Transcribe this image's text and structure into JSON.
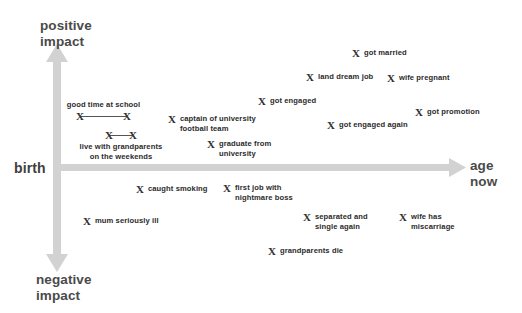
{
  "chart_data": {
    "type": "scatter",
    "title": "",
    "xlabel": "age now",
    "ylabel": "positive impact / negative impact",
    "origin_label": "birth",
    "axis_labels": {
      "positive": "positive\nimpact",
      "negative": "negative\nimpact",
      "x_end": "age\nnow",
      "origin": "birth"
    },
    "axis_color": "#cfcfcf",
    "marker_color": "#2e2e2e",
    "marker_glyph": "X",
    "grid": false,
    "legend": null,
    "xlim": [
      0,
      100
    ],
    "ylim": [
      -100,
      100
    ],
    "points": [
      {
        "label": "got married",
        "x": 352,
        "y": 47,
        "impact": "positive"
      },
      {
        "label": "land dream job",
        "x": 306,
        "y": 71,
        "impact": "positive"
      },
      {
        "label": "wife pregnant",
        "x": 387,
        "y": 72,
        "impact": "positive"
      },
      {
        "label": "got engaged",
        "x": 258,
        "y": 95,
        "impact": "positive"
      },
      {
        "label": "got promotion",
        "x": 415,
        "y": 106,
        "impact": "positive"
      },
      {
        "label": "captain of university\nfootball team",
        "x": 168,
        "y": 113,
        "impact": "positive"
      },
      {
        "label": "got engaged again",
        "x": 327,
        "y": 119,
        "impact": "positive"
      },
      {
        "label": "graduate from\nuniversity",
        "x": 207,
        "y": 138,
        "impact": "positive"
      },
      {
        "label": "caught smoking",
        "x": 136,
        "y": 183,
        "impact": "negative"
      },
      {
        "label": "first job with\nnightmare boss",
        "x": 223,
        "y": 182,
        "impact": "negative"
      },
      {
        "label": "mum seriously ill",
        "x": 83,
        "y": 215,
        "impact": "negative"
      },
      {
        "label": "separated and\nsingle again",
        "x": 303,
        "y": 211,
        "impact": "negative"
      },
      {
        "label": "wife has\nmiscarriage",
        "x": 399,
        "y": 211,
        "impact": "negative"
      },
      {
        "label": "grandparents die",
        "x": 268,
        "y": 245,
        "impact": "negative"
      }
    ],
    "spans": [
      {
        "label": "good time at school",
        "label_position": "above",
        "x_start": 80,
        "x_end": 127,
        "y": 100,
        "impact": "positive"
      },
      {
        "label": "live with grandparents\non the weekends",
        "label_position": "below",
        "x_start": 109,
        "x_end": 133,
        "y": 130,
        "impact": "positive"
      }
    ]
  }
}
